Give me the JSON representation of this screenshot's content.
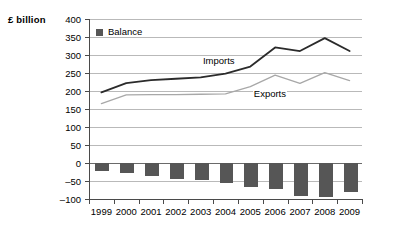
{
  "chart_data": {
    "type": "line",
    "title": "",
    "subtitle": "",
    "xlabel": "",
    "ylabel": "£ billion",
    "ylim": [
      -100,
      400
    ],
    "ytick_step": 50,
    "yticks": [
      400,
      350,
      300,
      250,
      200,
      150,
      100,
      50,
      0,
      -50,
      -100
    ],
    "ytick_labels": [
      "400",
      "350",
      "300",
      "250",
      "200",
      "150",
      "100",
      "50",
      "0",
      "–50",
      "–100"
    ],
    "grid": true,
    "legend_position": "top-left",
    "categories": [
      "1999",
      "2000",
      "2001",
      "2002",
      "2003",
      "2004",
      "2005",
      "2006",
      "2007",
      "2008",
      "2009"
    ],
    "series": [
      {
        "name": "Imports",
        "kind": "line",
        "color": "#2b2b2b",
        "values": [
          196,
          222,
          230,
          234,
          238,
          248,
          268,
          321,
          311,
          347,
          311
        ]
      },
      {
        "name": "Exports",
        "kind": "line",
        "color": "#a8a8a8",
        "values": [
          165,
          189,
          190,
          190,
          191,
          192,
          212,
          244,
          221,
          251,
          229
        ]
      },
      {
        "name": "Balance",
        "kind": "bar",
        "color": "#565656",
        "values": [
          -23,
          -27,
          -35,
          -44,
          -46,
          -55,
          -66,
          -71,
          -92,
          -95,
          -81
        ]
      }
    ],
    "annotations": [
      {
        "text": "Imports",
        "x": 2003.05,
        "y": 282
      },
      {
        "text": "Exports",
        "x": 2005.1,
        "y": 191
      }
    ],
    "legend_entries": [
      {
        "label": "Balance",
        "color": "#565656"
      }
    ]
  }
}
